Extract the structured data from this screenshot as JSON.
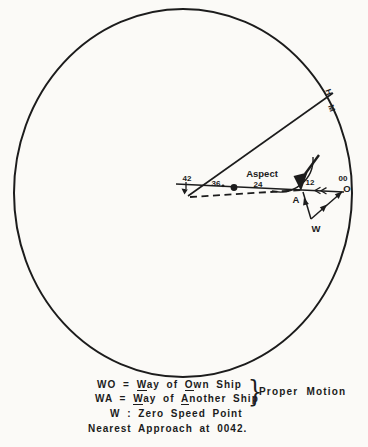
{
  "diagram": {
    "type": "radar relative-motion plot",
    "labels": {
      "t42": "42",
      "t36": "36",
      "t24": "24",
      "t12": "12",
      "t00": "00",
      "aspect": "Aspect",
      "point_a": "A",
      "point_o": "O",
      "point_w": "W",
      "heading_h": "H",
      "heading_m": "M"
    },
    "colors": {
      "ink": "#1c1c1c",
      "paper": "#fbfaf7"
    }
  },
  "legend": {
    "lines": [
      {
        "parts": [
          {
            "t": "WO = "
          },
          {
            "t": "W",
            "u": true
          },
          {
            "t": "ay of "
          },
          {
            "t": "O",
            "u": true
          },
          {
            "t": "wn Ship"
          }
        ]
      },
      {
        "parts": [
          {
            "t": "WA = "
          },
          {
            "t": "W",
            "u": true
          },
          {
            "t": "ay of "
          },
          {
            "t": "A",
            "u": true
          },
          {
            "t": "nother Ship"
          }
        ]
      },
      {
        "parts": [
          {
            "t": "W : Zero Speed Point"
          }
        ]
      },
      {
        "parts": [
          {
            "t": "Nearest Approach at 0042."
          }
        ]
      }
    ],
    "brace_label": "Proper Motion"
  }
}
